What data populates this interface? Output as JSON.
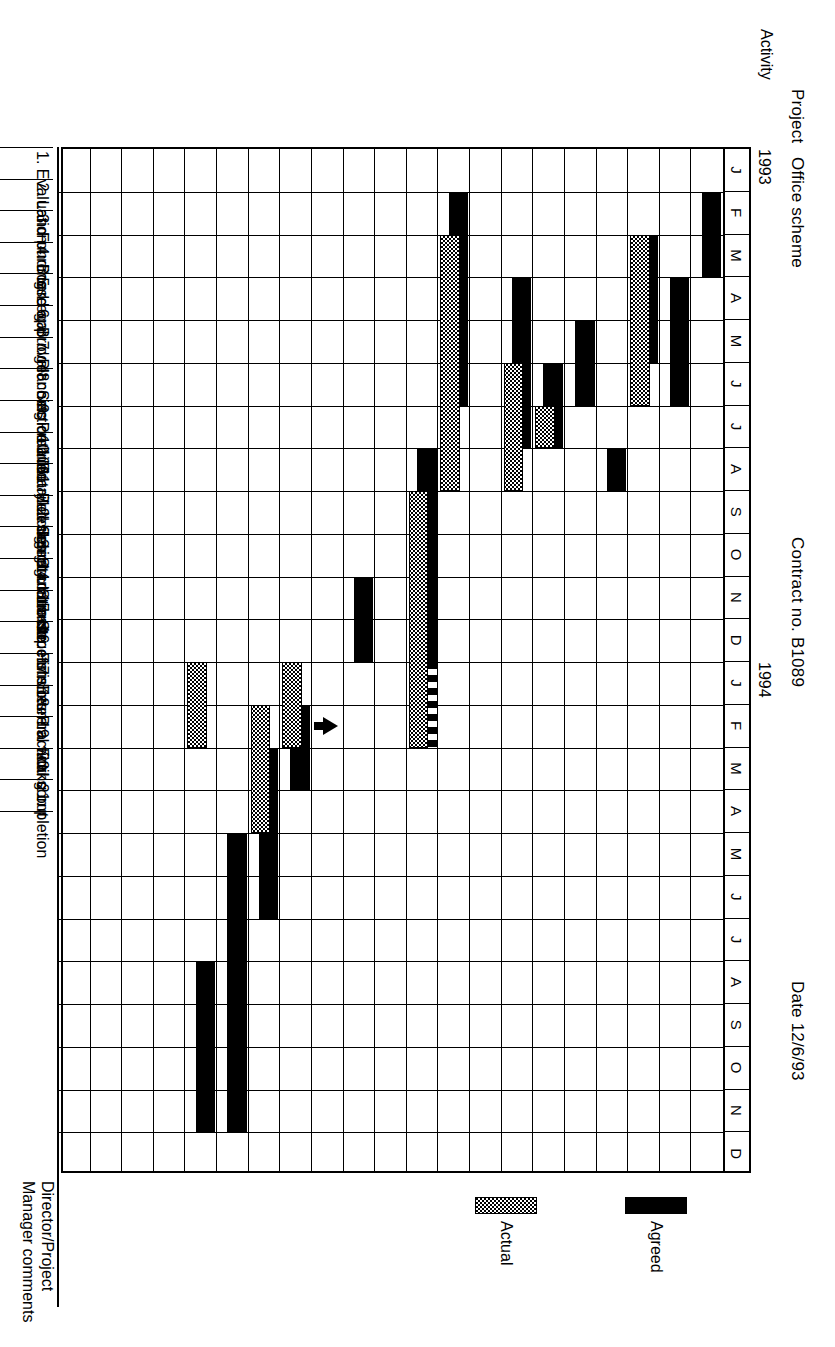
{
  "header": {
    "project_label": "Project",
    "project_value": "Office scheme",
    "contract": "Contract no. B1089",
    "date": "Date 12/6/93",
    "activity_label": "Activity"
  },
  "footer": {
    "comments_line1": "Director/Project",
    "comments_line2": "Manager comments"
  },
  "legend": {
    "agreed_label": "Agreed",
    "actual_label": "Actual",
    "agreed_color": "#000000",
    "actual_color": "#9a9a9a"
  },
  "chart_data": {
    "type": "bar",
    "subtitle": "Contract no. B1089, Date 12/6/93",
    "xlabel": "",
    "ylabel": "Activity",
    "orientation": "horizontal-gantt",
    "grid": true,
    "legend_position": "bottom-right",
    "years": [
      {
        "label": "1993",
        "start_month_index": 0
      },
      {
        "label": "1994",
        "start_month_index": 12
      }
    ],
    "month_ticks": [
      "J",
      "F",
      "M",
      "A",
      "M",
      "J",
      "J",
      "A",
      "S",
      "O",
      "N",
      "D",
      "J",
      "F",
      "M",
      "A",
      "M",
      "J",
      "J",
      "A",
      "S",
      "O",
      "N",
      "D"
    ],
    "xlim": [
      0,
      24
    ],
    "categories": [
      "1. Evaluation",
      "2. Land purchase",
      "3. Funding",
      "4. Board approval",
      "5. Legal",
      "6. Budget costs",
      "7. Planning detailed",
      "8. Section 106",
      "9. Preliminary design",
      "10. Detailed design",
      "11. Building regulations",
      "12. Select contractor",
      "13. Start on site",
      "14. Sub-structure",
      "15. Superstructure",
      "16. Finishes",
      "17. External works",
      "18. Practical completion",
      "19. Fitting out",
      "20.",
      "21."
    ],
    "series": [
      {
        "name": "Agreed",
        "style": "solid-black",
        "bars": [
          {
            "row": 0,
            "start": 1,
            "end": 3
          },
          {
            "row": 1,
            "start": 3,
            "end": 6
          },
          {
            "row": 2,
            "start": 2,
            "end": 5
          },
          {
            "row": 3,
            "start": 7,
            "end": 8
          },
          {
            "row": 4,
            "start": 4,
            "end": 6
          },
          {
            "row": 5,
            "start": 5,
            "end": 7
          },
          {
            "row": 6,
            "start": 3,
            "end": 7
          },
          {
            "row": 8,
            "start": 1,
            "end": 6
          },
          {
            "row": 9,
            "start": 7,
            "end": 13,
            "dashed_tail": true,
            "dash_from": 12,
            "dash_to": 14
          },
          {
            "row": 11,
            "start": 10,
            "end": 12
          },
          {
            "row": 13,
            "start": 13,
            "end": 15
          },
          {
            "row": 14,
            "start": 14,
            "end": 18
          },
          {
            "row": 15,
            "start": 16,
            "end": 23
          },
          {
            "row": 16,
            "start": 19,
            "end": 23
          }
        ]
      },
      {
        "name": "Actual",
        "style": "dotted-grey",
        "bars": [
          {
            "row": 2,
            "start": 2,
            "end": 6
          },
          {
            "row": 5,
            "start": 6,
            "end": 7
          },
          {
            "row": 6,
            "start": 5,
            "end": 8
          },
          {
            "row": 8,
            "start": 2,
            "end": 8
          },
          {
            "row": 9,
            "start": 8,
            "end": 14
          },
          {
            "row": 13,
            "start": 12,
            "end": 14
          },
          {
            "row": 14,
            "start": 13,
            "end": 16
          },
          {
            "row": 16,
            "start": 12,
            "end": 14
          }
        ]
      }
    ],
    "markers": [
      {
        "row": 12,
        "month": 13,
        "type": "arrow-up",
        "label": "Start on site"
      }
    ]
  }
}
